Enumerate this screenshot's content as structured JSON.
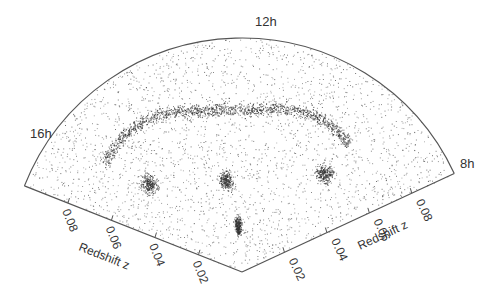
{
  "figure": {
    "type": "redshift-survey-wedge",
    "ra_labels": [
      {
        "label": "16h",
        "position": "left-edge"
      },
      {
        "label": "12h",
        "position": "top-center"
      },
      {
        "label": "8h",
        "position": "right-edge"
      }
    ],
    "redshift_axis": {
      "title": "Redshift z",
      "ticks": [
        "0.02",
        "0.04",
        "0.06",
        "0.08"
      ],
      "tick_values": [
        0.02,
        0.04,
        0.06,
        0.08
      ],
      "max": 0.1
    },
    "point_color": "#333333",
    "axis_color": "#555555"
  },
  "structures": [
    {
      "name": "great-wall-filament",
      "ra_h": [
        15.0,
        9.5
      ],
      "z": [
        0.075,
        0.07
      ],
      "density": "high"
    },
    {
      "name": "cluster-left",
      "ra_h": 14.7,
      "z": 0.055,
      "density": "medium"
    },
    {
      "name": "cluster-center",
      "ra_h": 12.5,
      "z": 0.04,
      "density": "medium"
    },
    {
      "name": "cluster-low-z",
      "ra_h": 12.2,
      "z": 0.02,
      "density": "medium"
    },
    {
      "name": "cluster-right",
      "ra_h": 9.5,
      "z": 0.055,
      "density": "medium"
    }
  ]
}
